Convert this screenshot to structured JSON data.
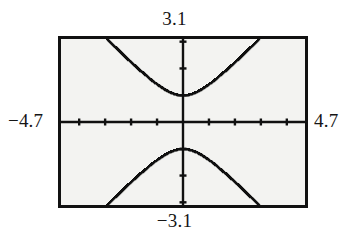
{
  "screen": {
    "kind": "graphing-calculator-viewport",
    "background_color": "#ffffff",
    "screen_fill_color": "#f3f3f1",
    "frame_color": "#111111"
  },
  "labels": {
    "ymax": "3.1",
    "ymin": "−3.1",
    "xmin": "−4.7",
    "xmax": "4.7"
  },
  "chart_data": {
    "type": "line",
    "title": "",
    "subtitle": "",
    "xlabel": "",
    "ylabel": "",
    "xlim": [
      -4.7,
      4.7
    ],
    "ylim": [
      -3.1,
      3.1
    ],
    "xtick_step": 1,
    "ytick_step": 1,
    "xticks": [
      -4,
      -3,
      -2,
      -1,
      1,
      2,
      3,
      4
    ],
    "yticks": [
      -3,
      -2,
      -1,
      1,
      2,
      3
    ],
    "tick_labels_shown": false,
    "grid": false,
    "legend": false,
    "axes_style": "crosshair-with-tick-marks",
    "curve_style": "dotted-pixel-trace",
    "curve_color": "#101010",
    "equation": "y = ± sqrt(1 + x^2)",
    "series": [
      {
        "name": "upper branch",
        "x": [
          -2.9,
          -2.7,
          -2.5,
          -2.3,
          -2.1,
          -1.9,
          -1.7,
          -1.5,
          -1.3,
          -1.1,
          -0.9,
          -0.7,
          -0.5,
          -0.3,
          -0.1,
          0.1,
          0.3,
          0.5,
          0.7,
          0.9,
          1.1,
          1.3,
          1.5,
          1.7,
          1.9,
          2.1,
          2.3,
          2.5,
          2.7,
          2.9
        ],
        "y": [
          3.068,
          2.879,
          2.693,
          2.508,
          2.326,
          2.147,
          1.972,
          1.803,
          1.64,
          1.487,
          1.345,
          1.221,
          1.118,
          1.044,
          1.005,
          1.005,
          1.044,
          1.118,
          1.221,
          1.345,
          1.487,
          1.64,
          1.803,
          1.972,
          2.147,
          2.326,
          2.508,
          2.693,
          2.879,
          3.068
        ]
      },
      {
        "name": "lower branch",
        "x": [
          -2.9,
          -2.7,
          -2.5,
          -2.3,
          -2.1,
          -1.9,
          -1.7,
          -1.5,
          -1.3,
          -1.1,
          -0.9,
          -0.7,
          -0.5,
          -0.3,
          -0.1,
          0.1,
          0.3,
          0.5,
          0.7,
          0.9,
          1.1,
          1.3,
          1.5,
          1.7,
          1.9,
          2.1,
          2.3,
          2.5,
          2.7,
          2.9
        ],
        "y": [
          -3.068,
          -2.879,
          -2.693,
          -2.508,
          -2.326,
          -2.147,
          -1.972,
          -1.803,
          -1.64,
          -1.487,
          -1.345,
          -1.221,
          -1.118,
          -1.044,
          -1.005,
          -1.005,
          -1.044,
          -1.118,
          -1.221,
          -1.345,
          -1.487,
          -1.64,
          -1.803,
          -1.972,
          -2.147,
          -2.326,
          -2.508,
          -2.693,
          -2.879,
          -3.068
        ]
      }
    ]
  }
}
